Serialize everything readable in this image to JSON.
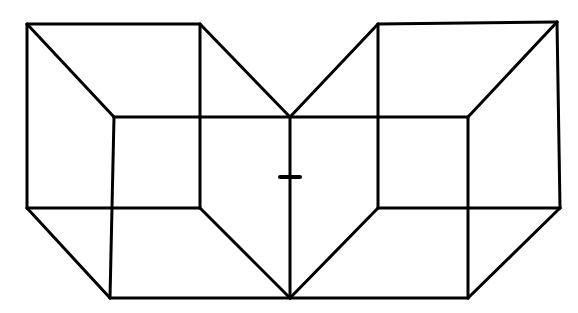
{
  "figure": {
    "stroke_color": "#000000",
    "background_color": "#ffffff",
    "stroke_width": 3,
    "fixation_mark": {
      "x": 290,
      "y": 177,
      "half_width": 10
    },
    "edges": [
      {
        "x1": 27,
        "y1": 24,
        "x2": 200,
        "y2": 24
      },
      {
        "x1": 27,
        "y1": 24,
        "x2": 27,
        "y2": 208
      },
      {
        "x1": 27,
        "y1": 24,
        "x2": 114,
        "y2": 117
      },
      {
        "x1": 200,
        "y1": 24,
        "x2": 200,
        "y2": 208
      },
      {
        "x1": 200,
        "y1": 24,
        "x2": 290,
        "y2": 117
      },
      {
        "x1": 114,
        "y1": 117,
        "x2": 468,
        "y2": 117
      },
      {
        "x1": 114,
        "y1": 117,
        "x2": 110,
        "y2": 298
      },
      {
        "x1": 290,
        "y1": 117,
        "x2": 290,
        "y2": 298
      },
      {
        "x1": 27,
        "y1": 208,
        "x2": 200,
        "y2": 208
      },
      {
        "x1": 27,
        "y1": 208,
        "x2": 110,
        "y2": 298
      },
      {
        "x1": 200,
        "y1": 208,
        "x2": 290,
        "y2": 298
      },
      {
        "x1": 110,
        "y1": 298,
        "x2": 468,
        "y2": 298
      },
      {
        "x1": 290,
        "y1": 117,
        "x2": 378,
        "y2": 24
      },
      {
        "x1": 378,
        "y1": 24,
        "x2": 557,
        "y2": 22
      },
      {
        "x1": 378,
        "y1": 24,
        "x2": 378,
        "y2": 208
      },
      {
        "x1": 557,
        "y1": 22,
        "x2": 468,
        "y2": 117
      },
      {
        "x1": 557,
        "y1": 22,
        "x2": 560,
        "y2": 208
      },
      {
        "x1": 468,
        "y1": 117,
        "x2": 468,
        "y2": 298
      },
      {
        "x1": 378,
        "y1": 208,
        "x2": 560,
        "y2": 208
      },
      {
        "x1": 378,
        "y1": 208,
        "x2": 290,
        "y2": 298
      },
      {
        "x1": 560,
        "y1": 208,
        "x2": 468,
        "y2": 298
      }
    ]
  }
}
